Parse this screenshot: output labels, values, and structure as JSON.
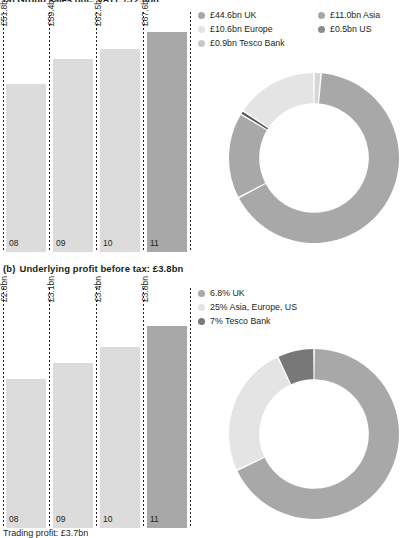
{
  "page": {
    "clipped_top_title": "(a) Group sales (inc. VAT): £72.0bn",
    "clipped_bottom_caption": "Trading profit: £3.7bn"
  },
  "section_b": {
    "marker": "(b)",
    "title": "Underlying profit before tax: £3.8bn"
  },
  "colors": {
    "uk": "#a8a8a8",
    "europe": "#e4e4e4",
    "tesco_bank": "#787878",
    "asia": "#a8a8a8",
    "us": "#5a5a5a",
    "bar": "#dcdcdc",
    "bar_accent": "#a8a8a8",
    "text": "#231f20",
    "background": "#ffffff"
  },
  "chart_data": [
    {
      "id": "sales-bars",
      "type": "bar",
      "title": "Group sales (inc. VAT)",
      "xlabel": "",
      "ylabel": "",
      "categories": [
        "08",
        "09",
        "10",
        "11"
      ],
      "values": [
        51.8,
        59.4,
        62.5,
        67.6
      ],
      "value_labels": [
        "£51.8bn",
        "£59.4bn",
        "£62.5bn",
        "£67.6bn"
      ],
      "ylim": [
        0,
        72.0
      ],
      "grid": false,
      "highlight_index": 3,
      "units": "£bn"
    },
    {
      "id": "sales-donut",
      "type": "pie",
      "title": "Group sales by segment",
      "labels": [
        "£44.6bn UK",
        "£11.0bn Asia",
        "£10.6bn Europe",
        "£0.5bn US",
        "£0.9bn Tesco Bank"
      ],
      "categories": [
        "UK",
        "Asia",
        "Europe",
        "US",
        "Tesco Bank"
      ],
      "values": [
        44.6,
        11.0,
        10.6,
        0.5,
        0.9
      ],
      "colors": [
        "#a8a8a8",
        "#a8a8a8",
        "#e4e4e4",
        "#5a5a5a",
        "#d6d6d6"
      ],
      "legend_position": "top",
      "units": "£bn"
    },
    {
      "id": "profit-bars",
      "type": "bar",
      "title": "Underlying profit before tax",
      "xlabel": "",
      "ylabel": "",
      "categories": [
        "08",
        "09",
        "10",
        "11"
      ],
      "values": [
        2.8,
        3.1,
        3.4,
        3.8
      ],
      "value_labels": [
        "£2.8bn",
        "£3.1bn",
        "£3.4bn",
        "£3.8bn"
      ],
      "ylim": [
        0,
        4.4
      ],
      "grid": false,
      "highlight_index": 3,
      "units": "£bn"
    },
    {
      "id": "profit-donut",
      "type": "pie",
      "title": "Underlying profit by segment",
      "labels": [
        "6.8% UK",
        "25% Asia, Europe, US",
        "7% Tesco Bank"
      ],
      "categories": [
        "UK",
        "Asia, Europe, US",
        "Tesco Bank"
      ],
      "values": [
        68,
        25,
        7
      ],
      "colors": [
        "#a8a8a8",
        "#e4e4e4",
        "#787878"
      ],
      "legend_position": "top",
      "units": "%"
    }
  ],
  "legend_sales": {
    "column_left": [
      {
        "label": "£44.6bn UK",
        "color": "#a8a8a8"
      },
      {
        "label": "£10.6bn Europe",
        "color": "#e4e4e4"
      },
      {
        "label": "£0.9bn Tesco Bank",
        "color": "#c9c9c9"
      }
    ],
    "column_right": [
      {
        "label": "£11.0bn Asia",
        "color": "#a8a8a8"
      },
      {
        "label": "£0.5bn US",
        "color": "#8c8c8c"
      }
    ]
  },
  "legend_profit": {
    "items": [
      {
        "label": "6.8% UK",
        "color": "#a8a8a8"
      },
      {
        "label": "25% Asia, Europe, US",
        "color": "#e4e4e4"
      },
      {
        "label": "7% Tesco Bank",
        "color": "#787878"
      }
    ]
  }
}
